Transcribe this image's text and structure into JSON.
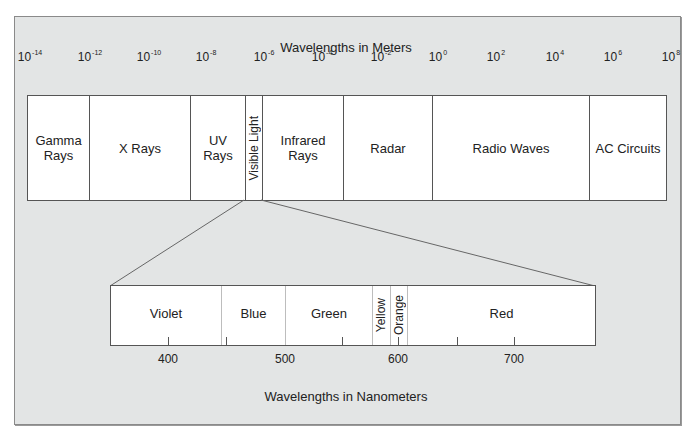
{
  "diagram": {
    "title_top": "Wavelengths in Meters",
    "title_bottom": "Wavelengths in Nanometers",
    "meter_ticks": [
      {
        "base": "10",
        "exp": "-14"
      },
      {
        "base": "10",
        "exp": "-12"
      },
      {
        "base": "10",
        "exp": "-10"
      },
      {
        "base": "10",
        "exp": "-8"
      },
      {
        "base": "10",
        "exp": "-6"
      },
      {
        "base": "10",
        "exp": "-4"
      },
      {
        "base": "10",
        "exp": "-2"
      },
      {
        "base": "10",
        "exp": "0"
      },
      {
        "base": "10",
        "exp": "2"
      },
      {
        "base": "10",
        "exp": "4"
      },
      {
        "base": "10",
        "exp": "6"
      },
      {
        "base": "10",
        "exp": "8"
      }
    ],
    "spectrum_bands": [
      {
        "label": "Gamma Rays",
        "line1": "Gamma",
        "line2": "Rays"
      },
      {
        "label": "X Rays"
      },
      {
        "label": "UV Rays",
        "line1": "UV",
        "line2": "Rays"
      },
      {
        "label": "Visible Light"
      },
      {
        "label": "Infrared Rays",
        "line1": "Infrared",
        "line2": "Rays"
      },
      {
        "label": "Radar"
      },
      {
        "label": "Radio Waves"
      },
      {
        "label": "AC Circuits"
      }
    ],
    "visible_bands": [
      {
        "label": "Violet"
      },
      {
        "label": "Blue"
      },
      {
        "label": "Green"
      },
      {
        "label": "Yellow"
      },
      {
        "label": "Orange"
      },
      {
        "label": "Red"
      }
    ],
    "nanometer_ticks": [
      "400",
      "500",
      "600",
      "700"
    ],
    "colors": {
      "frame_background": "#e3e5e5",
      "band_fill": "#ffffff",
      "line": "#555555"
    }
  }
}
